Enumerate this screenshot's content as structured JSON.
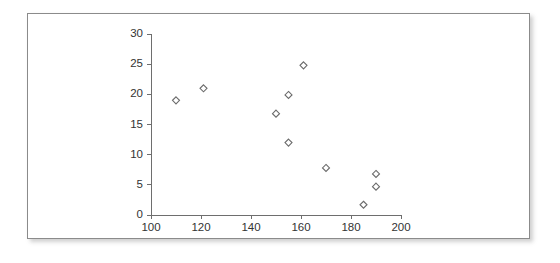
{
  "figure": {
    "background_color": "#ffffff",
    "frame_border_color": "#8b8b8b",
    "axis_color": "#6e6e6e",
    "marker_outline_color": "#6b6b6b",
    "marker_fill_color": "#ffffff"
  },
  "chart_data": {
    "type": "scatter",
    "title": "",
    "subtitle": "",
    "xlabel": "",
    "ylabel": "",
    "xlim": [
      100,
      200
    ],
    "ylim": [
      0,
      30
    ],
    "xticks": [
      100,
      120,
      140,
      160,
      180,
      200
    ],
    "yticks": [
      0,
      5,
      10,
      15,
      20,
      25,
      30
    ],
    "xtick_labels": [
      "100",
      "120",
      "140",
      "160",
      "180",
      "200"
    ],
    "ytick_labels": [
      "0",
      "5",
      "10",
      "15",
      "20",
      "25",
      "30"
    ],
    "grid": false,
    "legend": null,
    "legend_position": "none",
    "marker_shape": "diamond-open",
    "marker_size": 7,
    "annotations": [],
    "series": [
      {
        "name": "data",
        "points": [
          {
            "x": 110,
            "y": 19.0
          },
          {
            "x": 121,
            "y": 21.0
          },
          {
            "x": 150,
            "y": 16.8
          },
          {
            "x": 155,
            "y": 19.9
          },
          {
            "x": 155,
            "y": 12.0
          },
          {
            "x": 161,
            "y": 24.8
          },
          {
            "x": 170,
            "y": 7.8
          },
          {
            "x": 185,
            "y": 1.7
          },
          {
            "x": 190,
            "y": 6.8
          },
          {
            "x": 190,
            "y": 4.7
          }
        ]
      }
    ]
  }
}
